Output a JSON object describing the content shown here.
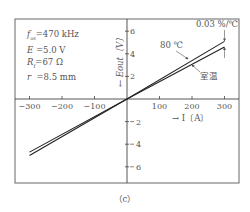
{
  "params": [
    {
      "label": "f_os",
      "value": "=470 kHz"
    },
    {
      "label": "E",
      "value": "=5.0 V"
    },
    {
      "label": "R_f",
      "value": "=67 Ω"
    },
    {
      "label": "r",
      "value": "=8.5 mm"
    }
  ],
  "caption": "（c）",
  "chart_data": {
    "type": "line",
    "title": "",
    "xlabel": "I〔A〕",
    "ylabel": "E_out〔V〕",
    "xlim": [
      -300,
      300
    ],
    "ylim": [
      -6,
      6
    ],
    "x_ticks": [
      -300,
      -200,
      -100,
      100,
      200,
      300
    ],
    "x_tick_labels": [
      "−300",
      "−200",
      "−100",
      "100",
      "200",
      "300"
    ],
    "y_ticks": [
      6,
      4,
      2,
      -2,
      -4,
      -6
    ],
    "y_tick_labels": [
      "6",
      "4",
      "2",
      "2",
      "4",
      "6"
    ],
    "grid": false,
    "series": [
      {
        "name": "80 ℃",
        "x": [
          -300,
          0,
          300
        ],
        "y": [
          -5.0,
          0,
          5.1
        ]
      },
      {
        "name": "室温",
        "x": [
          -300,
          0,
          300
        ],
        "y": [
          -4.7,
          0,
          4.6
        ]
      }
    ],
    "annotations": [
      {
        "text": "0.03 %/℃",
        "at_x": 300,
        "note": "dimension arrow between the two lines at I=300 A"
      },
      {
        "text": "80 ℃",
        "points_to": "upper line"
      },
      {
        "text": "室温",
        "points_to": "lower line"
      }
    ]
  }
}
